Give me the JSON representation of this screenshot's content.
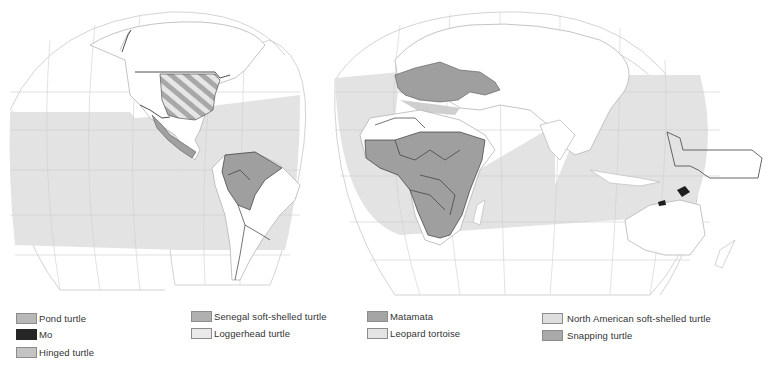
{
  "map": {
    "projection": "interrupted-world",
    "colors": {
      "background": "#ffffff",
      "ocean_range_fill": "#e3e3e3",
      "land_outline": "#b5b5b5",
      "country_border": "#3a3a3a",
      "graticule": "#c8c8c8",
      "range_dark": "#9f9f9f",
      "range_black": "#1e1e1e",
      "hatch": "#a8a8a8"
    }
  },
  "legend": {
    "items": [
      {
        "label": "Pond turtle",
        "color": "#b8b8b8"
      },
      {
        "label": "Mo",
        "color": "#262626"
      },
      {
        "label": "Hinged turtle",
        "color": "#c4c4c4"
      },
      {
        "label": "Senegal soft-shelled turtle",
        "color": "#b0b0b0"
      },
      {
        "label": "Loggerhead turtle",
        "color": "#e9e9e9"
      },
      {
        "label": "Matamata",
        "color": "#a5a5a5"
      },
      {
        "label": "Leopard tortoise",
        "color": "#e4e4e4"
      },
      {
        "label": "North American soft-shelled turtle",
        "color": "#dedede"
      },
      {
        "label": "Snapping turtle",
        "color": "#a9a9a9"
      }
    ]
  }
}
